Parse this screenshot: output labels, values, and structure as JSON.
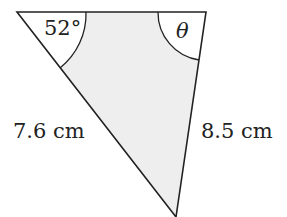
{
  "diagram": {
    "type": "triangle",
    "vertices": {
      "top_left": [
        17,
        12
      ],
      "top_right": [
        206,
        12
      ],
      "bottom": [
        176,
        217
      ]
    },
    "fill_color": "#eeeeee",
    "stroke_color": "#222222",
    "angles": {
      "top_left": "52°",
      "top_right": "θ"
    },
    "sides": {
      "left": "7.6 cm",
      "right": "8.5 cm"
    }
  }
}
